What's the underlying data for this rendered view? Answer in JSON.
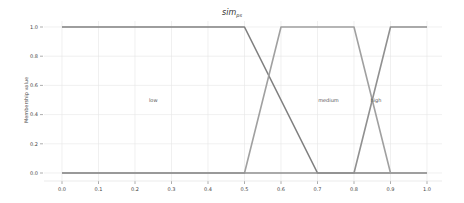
{
  "chart_data": {
    "type": "line",
    "title_main": "sim",
    "title_sub": "ps",
    "xlabel": "",
    "ylabel": "Membership value",
    "xlim": [
      0.0,
      1.0
    ],
    "ylim": [
      0.0,
      1.0
    ],
    "grid": true,
    "legend": "none",
    "x_ticks": [
      "0.0",
      "0.1",
      "0.2",
      "0.3",
      "0.4",
      "0.5",
      "0.6",
      "0.7",
      "0.8",
      "0.9",
      "1.0"
    ],
    "y_ticks": [
      "0.0",
      "0.2",
      "0.4",
      "0.6",
      "0.8",
      "1.0"
    ],
    "series": [
      {
        "name": "low",
        "color": "#808080",
        "x": [
          0.0,
          0.5,
          0.7,
          1.0
        ],
        "y": [
          1.0,
          1.0,
          0.0,
          0.0
        ]
      },
      {
        "name": "medium",
        "color": "#a0a0a0",
        "x": [
          0.0,
          0.5,
          0.6,
          0.8,
          0.9,
          1.0
        ],
        "y": [
          0.0,
          0.0,
          1.0,
          1.0,
          0.0,
          0.0
        ]
      },
      {
        "name": "high",
        "color": "#909090",
        "x": [
          0.0,
          0.8,
          0.9,
          1.0
        ],
        "y": [
          0.0,
          0.0,
          1.0,
          1.0
        ]
      }
    ],
    "annotations": [
      {
        "text": "low",
        "x": 0.25,
        "y": 0.5
      },
      {
        "text": "medium",
        "x": 0.73,
        "y": 0.5
      },
      {
        "text": "high",
        "x": 0.86,
        "y": 0.5
      }
    ]
  }
}
